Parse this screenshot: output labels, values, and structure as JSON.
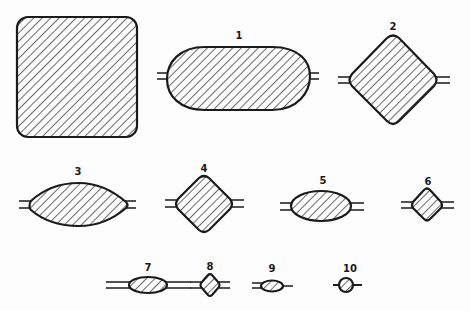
{
  "diagram": {
    "colors": {
      "stroke": "#1a1a1a",
      "background": "#fdfdfd",
      "hatch": "#2a2a2a"
    },
    "shapes": [
      {
        "id": "0",
        "label": "",
        "kind": "rounded-square",
        "leads": false
      },
      {
        "id": "1",
        "label": "1",
        "kind": "ellipse-capsule",
        "leads": true
      },
      {
        "id": "2",
        "label": "2",
        "kind": "rounded-diamond",
        "leads": true
      },
      {
        "id": "3",
        "label": "3",
        "kind": "lens",
        "leads": true
      },
      {
        "id": "4",
        "label": "4",
        "kind": "rounded-diamond",
        "leads": true
      },
      {
        "id": "5",
        "label": "5",
        "kind": "ellipse",
        "leads": true
      },
      {
        "id": "6",
        "label": "6",
        "kind": "rounded-diamond",
        "leads": true
      },
      {
        "id": "7",
        "label": "7",
        "kind": "ellipse",
        "leads": true
      },
      {
        "id": "8",
        "label": "8",
        "kind": "rounded-diamond",
        "leads": true
      },
      {
        "id": "9",
        "label": "9",
        "kind": "ellipse",
        "leads": true
      },
      {
        "id": "10",
        "label": "10",
        "kind": "circle",
        "leads": true
      }
    ]
  }
}
